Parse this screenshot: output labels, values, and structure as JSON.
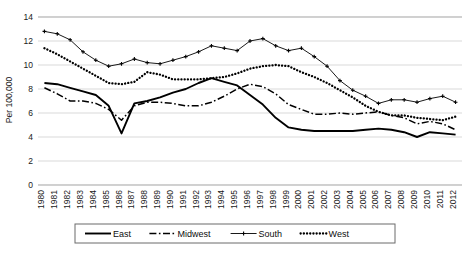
{
  "chart_data": {
    "type": "line",
    "title": "",
    "xlabel": "",
    "ylabel": "Per 100,000",
    "ylim": [
      0,
      14
    ],
    "ytick_step": 2,
    "yticks": [
      "0",
      "2",
      "4",
      "6",
      "8",
      "10",
      "12",
      "14"
    ],
    "grid": true,
    "legend_position": "bottom",
    "x": [
      "1980",
      "1981",
      "1982",
      "1983",
      "1984",
      "1985",
      "1986",
      "1987",
      "1988",
      "1989",
      "1990",
      "1991",
      "1992",
      "1993",
      "1994",
      "1995",
      "1996",
      "1997",
      "1998",
      "1999",
      "2000",
      "2001",
      "2002",
      "2003",
      "2004",
      "2005",
      "2006",
      "2007",
      "2008",
      "2009",
      "2010",
      "2011",
      "2012"
    ],
    "series": [
      {
        "name": "East",
        "style": "solid",
        "marker": "none",
        "values": [
          8.5,
          8.4,
          8.1,
          7.8,
          7.5,
          6.6,
          4.3,
          6.8,
          7.0,
          7.3,
          7.7,
          8.0,
          8.5,
          8.9,
          8.6,
          8.3,
          7.5,
          6.7,
          5.6,
          4.8,
          4.6,
          4.5,
          4.5,
          4.5,
          4.5,
          4.6,
          4.7,
          4.6,
          4.4,
          4.0,
          4.4,
          4.3,
          4.2
        ]
      },
      {
        "name": "Midwest",
        "style": "dashdot",
        "marker": "none",
        "values": [
          8.1,
          7.6,
          7.0,
          7.0,
          6.8,
          6.3,
          5.4,
          6.6,
          6.9,
          6.9,
          6.8,
          6.6,
          6.6,
          6.9,
          7.4,
          8.0,
          8.4,
          8.2,
          7.6,
          6.7,
          6.3,
          5.9,
          5.9,
          6.0,
          5.9,
          6.0,
          6.1,
          5.8,
          5.6,
          5.1,
          5.3,
          5.1,
          4.6
        ]
      },
      {
        "name": "South",
        "style": "solid-thin",
        "marker": "plus",
        "values": [
          12.8,
          12.6,
          12.1,
          11.1,
          10.4,
          9.9,
          10.1,
          10.5,
          10.2,
          10.1,
          10.4,
          10.7,
          11.1,
          11.6,
          11.4,
          11.2,
          12.0,
          12.2,
          11.6,
          11.2,
          11.4,
          10.7,
          9.9,
          8.7,
          7.9,
          7.4,
          6.8,
          7.1,
          7.1,
          6.9,
          7.2,
          7.4,
          6.9
        ]
      },
      {
        "name": "West",
        "style": "dotted",
        "marker": "none",
        "values": [
          11.4,
          10.9,
          10.3,
          9.7,
          9.1,
          8.5,
          8.4,
          8.6,
          9.4,
          9.2,
          8.8,
          8.8,
          8.8,
          8.9,
          9.0,
          9.3,
          9.7,
          9.9,
          10.0,
          9.9,
          9.4,
          9.0,
          8.5,
          7.9,
          7.3,
          6.6,
          6.1,
          5.8,
          5.8,
          5.6,
          5.5,
          5.4,
          5.7
        ]
      }
    ]
  },
  "legend": {
    "items": [
      {
        "label": "East",
        "style": "solid"
      },
      {
        "label": "Midwest",
        "style": "dashdot"
      },
      {
        "label": "South",
        "style": "plus-line"
      },
      {
        "label": "West",
        "style": "dotted"
      }
    ]
  },
  "colors": {
    "series": "#000000",
    "gridline": "#d9d9d9",
    "plot_border": "#b5b5b5",
    "background": "#ffffff",
    "text": "#1a1a1a"
  }
}
